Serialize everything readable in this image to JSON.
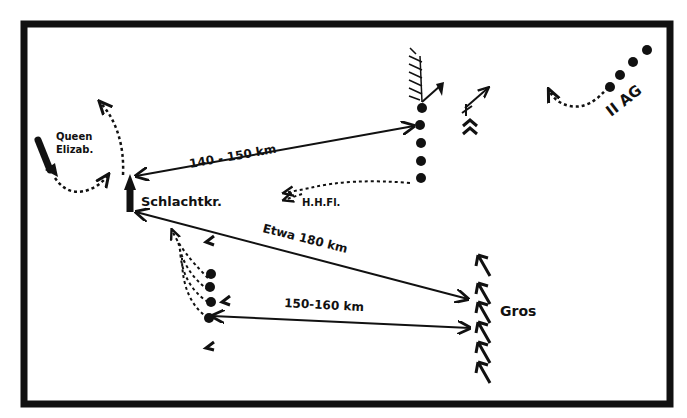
{
  "diagram": {
    "type": "naval-battle-sketch",
    "colors": {
      "ink": "#111111",
      "paper": "#ffffff"
    },
    "labels": {
      "queen_elizabeth": [
        "Queen",
        "Elizab."
      ],
      "battlecruisers": "Schlachtkr.",
      "fleet": "H.H.Fl.",
      "main_fleet": "Gros",
      "squadron": "II AG"
    },
    "distances": {
      "upper": "140 - 150 km",
      "diagonal": "Etwa 180 km",
      "lower": "150-160 km"
    }
  }
}
